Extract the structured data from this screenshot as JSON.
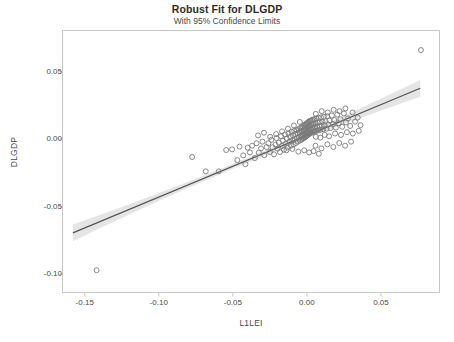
{
  "chart_data": {
    "type": "scatter",
    "title": "Robust Fit for DLGDP",
    "subtitle": "With 95% Confidence Limits",
    "xlabel": "L1LEI",
    "ylabel": "DLGDP",
    "xlim": [
      -0.165,
      0.0895
    ],
    "ylim": [
      -0.1135,
      0.0805
    ],
    "xticks": [
      -0.15,
      -0.1,
      -0.05,
      0.0,
      0.05
    ],
    "xtick_labels": [
      "-0.15",
      "-0.10",
      "-0.05",
      "0.00",
      "0.05"
    ],
    "yticks": [
      0.05,
      0.0,
      -0.05,
      -0.1
    ],
    "ytick_labels": [
      "0.05",
      "0.00",
      "-0.05",
      "-0.10"
    ],
    "grid": false,
    "legend": false,
    "marker": {
      "shape": "open-circle",
      "size": 5,
      "color": "#7a7a7a",
      "fill": "none"
    },
    "fit_line": {
      "label": "Robust fit",
      "color": "#555555",
      "slope": 0.4565,
      "intercept": 0.0028,
      "x_start": -0.158,
      "x_end": 0.0765
    },
    "confidence_band": {
      "label": "95% Confidence Limits",
      "level": 0.95,
      "color": "#cfcfcf",
      "half_width_center": 0.0018,
      "half_width_edge": 0.0062
    },
    "points": [
      [
        -0.142,
        -0.097
      ],
      [
        -0.0775,
        -0.0132
      ],
      [
        -0.0683,
        -0.0238
      ],
      [
        -0.0595,
        -0.0238
      ],
      [
        -0.0545,
        -0.008
      ],
      [
        -0.0505,
        -0.0075
      ],
      [
        -0.047,
        -0.0155
      ],
      [
        -0.0455,
        -0.0055
      ],
      [
        -0.043,
        -0.012
      ],
      [
        -0.0415,
        -0.0185
      ],
      [
        -0.04,
        -0.0062
      ],
      [
        -0.0385,
        -0.0098
      ],
      [
        -0.037,
        -0.0048
      ],
      [
        -0.0352,
        -0.014
      ],
      [
        -0.034,
        -0.003
      ],
      [
        -0.0325,
        -0.01
      ],
      [
        -0.031,
        -0.0068
      ],
      [
        -0.03,
        -0.0018
      ],
      [
        -0.0288,
        -0.0118
      ],
      [
        -0.0272,
        -0.0058
      ],
      [
        -0.026,
        -0.003
      ],
      [
        -0.025,
        -0.0095
      ],
      [
        -0.024,
        -0.0005
      ],
      [
        -0.0232,
        -0.006
      ],
      [
        -0.0222,
        -0.0112
      ],
      [
        -0.0212,
        -0.004
      ],
      [
        -0.0205,
        0.0008
      ],
      [
        -0.0198,
        -0.007
      ],
      [
        -0.019,
        -0.0025
      ],
      [
        -0.0182,
        -0.0095
      ],
      [
        -0.0175,
        0.0022
      ],
      [
        -0.0168,
        -0.005
      ],
      [
        -0.0162,
        -0.001
      ],
      [
        -0.0155,
        -0.0078
      ],
      [
        -0.0148,
        0.0035
      ],
      [
        -0.0142,
        -0.0032
      ],
      [
        -0.0136,
        0.0005
      ],
      [
        -0.013,
        -0.0062
      ],
      [
        -0.0124,
        0.0042
      ],
      [
        -0.0118,
        -0.0018
      ],
      [
        -0.0113,
        0.0018
      ],
      [
        -0.0108,
        -0.0048
      ],
      [
        -0.0103,
        0.0055
      ],
      [
        -0.0098,
        -0.0008
      ],
      [
        -0.0094,
        0.0028
      ],
      [
        -0.009,
        -0.0038
      ],
      [
        -0.0086,
        0.0062
      ],
      [
        -0.0082,
        0.0002
      ],
      [
        -0.0078,
        0.0038
      ],
      [
        -0.0074,
        -0.0028
      ],
      [
        -0.007,
        0.0068
      ],
      [
        -0.0066,
        0.001
      ],
      [
        -0.0063,
        0.0045
      ],
      [
        -0.006,
        -0.0018
      ],
      [
        -0.0057,
        0.0075
      ],
      [
        -0.0054,
        0.0015
      ],
      [
        -0.0051,
        0.005
      ],
      [
        -0.0048,
        -0.001
      ],
      [
        -0.0045,
        0.0082
      ],
      [
        -0.0043,
        0.0022
      ],
      [
        -0.004,
        0.0055
      ],
      [
        -0.0038,
        -0.0004
      ],
      [
        -0.0036,
        0.0088
      ],
      [
        -0.0034,
        0.0028
      ],
      [
        -0.0032,
        0.006
      ],
      [
        -0.003,
        0.0002
      ],
      [
        -0.0028,
        0.0095
      ],
      [
        -0.0026,
        0.0032
      ],
      [
        -0.0024,
        0.0065
      ],
      [
        -0.0022,
        0.0008
      ],
      [
        -0.002,
        0.01
      ],
      [
        -0.0019,
        0.0038
      ],
      [
        -0.0017,
        0.007
      ],
      [
        -0.0016,
        0.0012
      ],
      [
        -0.0014,
        0.0105
      ],
      [
        -0.0013,
        0.0042
      ],
      [
        -0.0011,
        0.0075
      ],
      [
        -0.001,
        0.0018
      ],
      [
        -0.0009,
        0.011
      ],
      [
        -0.0007,
        0.0048
      ],
      [
        -0.0006,
        0.008
      ],
      [
        -0.0005,
        0.0022
      ],
      [
        -0.0004,
        0.0115
      ],
      [
        -0.0002,
        0.0052
      ],
      [
        -0.0001,
        0.0085
      ],
      [
        0.0,
        0.0028
      ],
      [
        0.0002,
        0.012
      ],
      [
        0.0003,
        0.0058
      ],
      [
        0.0004,
        0.009
      ],
      [
        0.0006,
        0.0032
      ],
      [
        0.0007,
        0.0125
      ],
      [
        0.0008,
        0.0062
      ],
      [
        0.001,
        0.0095
      ],
      [
        0.0011,
        0.0038
      ],
      [
        0.0013,
        0.013
      ],
      [
        0.0014,
        0.0068
      ],
      [
        0.0016,
        0.0098
      ],
      [
        0.0017,
        0.0042
      ],
      [
        0.0019,
        0.0135
      ],
      [
        0.0021,
        0.0072
      ],
      [
        0.0022,
        0.0102
      ],
      [
        0.0024,
        0.0046
      ],
      [
        0.0026,
        0.0138
      ],
      [
        0.0028,
        0.0076
      ],
      [
        0.003,
        0.0106
      ],
      [
        0.0032,
        0.005
      ],
      [
        0.0034,
        0.0142
      ],
      [
        0.0036,
        0.008
      ],
      [
        0.0038,
        0.011
      ],
      [
        0.004,
        0.0054
      ],
      [
        0.0043,
        0.0146
      ],
      [
        0.0045,
        0.0084
      ],
      [
        0.0048,
        0.0114
      ],
      [
        0.005,
        0.0058
      ],
      [
        0.0053,
        0.015
      ],
      [
        0.0056,
        0.0088
      ],
      [
        0.0059,
        0.0118
      ],
      [
        0.0062,
        0.0062
      ],
      [
        0.0065,
        0.0154
      ],
      [
        0.0068,
        0.0092
      ],
      [
        0.0072,
        0.0122
      ],
      [
        0.0075,
        0.0066
      ],
      [
        0.0079,
        0.0158
      ],
      [
        0.0083,
        0.0096
      ],
      [
        0.0087,
        0.0126
      ],
      [
        0.0091,
        0.007
      ],
      [
        0.0095,
        0.0162
      ],
      [
        0.01,
        0.01
      ],
      [
        0.0105,
        0.013
      ],
      [
        0.011,
        0.0074
      ],
      [
        0.0115,
        0.0166
      ],
      [
        0.012,
        0.0104
      ],
      [
        0.0126,
        0.0134
      ],
      [
        0.0132,
        0.0078
      ],
      [
        0.0138,
        0.017
      ],
      [
        0.0145,
        0.0108
      ],
      [
        0.0152,
        0.0138
      ],
      [
        0.016,
        0.0082
      ],
      [
        0.0168,
        0.0176
      ],
      [
        0.0176,
        0.0112
      ],
      [
        0.0185,
        0.0142
      ],
      [
        0.0195,
        0.0086
      ],
      [
        0.0205,
        0.0182
      ],
      [
        0.0215,
        0.0118
      ],
      [
        0.0226,
        0.0148
      ],
      [
        0.0238,
        0.0092
      ],
      [
        0.025,
        0.019
      ],
      [
        0.0263,
        0.0124
      ],
      [
        0.0277,
        0.0154
      ],
      [
        0.0292,
        0.0098
      ],
      [
        0.0308,
        0.0198
      ],
      [
        0.0325,
        0.013
      ],
      [
        0.0343,
        0.016
      ],
      [
        0.0362,
        0.0104
      ],
      [
        -0.0048,
        0.0128
      ],
      [
        -0.0088,
        0.0102
      ],
      [
        -0.0128,
        0.0078
      ],
      [
        -0.0168,
        0.0058
      ],
      [
        -0.0208,
        0.0038
      ],
      [
        -0.0248,
        0.0018
      ],
      [
        -0.029,
        0.0048
      ],
      [
        -0.033,
        0.0028
      ],
      [
        0.0058,
        -0.0048
      ],
      [
        0.0098,
        -0.0068
      ],
      [
        0.0138,
        -0.0038
      ],
      [
        0.0178,
        -0.0058
      ],
      [
        0.0218,
        -0.0028
      ],
      [
        0.0258,
        -0.0048
      ],
      [
        0.0298,
        -0.0018
      ],
      [
        0.006,
        0.0188
      ],
      [
        0.01,
        0.0208
      ],
      [
        0.014,
        0.0198
      ],
      [
        0.018,
        0.0218
      ],
      [
        0.022,
        0.0208
      ],
      [
        0.026,
        0.0228
      ],
      [
        0.006,
        0.0018
      ],
      [
        0.009,
        0.0012
      ],
      [
        0.012,
        0.0032
      ],
      [
        0.015,
        0.0022
      ],
      [
        0.019,
        0.0042
      ],
      [
        0.023,
        0.0032
      ],
      [
        0.027,
        0.0052
      ],
      [
        0.031,
        0.0042
      ],
      [
        0.035,
        0.0062
      ],
      [
        0.0015,
        -0.0098
      ],
      [
        0.0045,
        -0.0088
      ],
      [
        0.008,
        -0.0108
      ],
      [
        -0.0018,
        -0.0082
      ],
      [
        -0.0058,
        -0.0092
      ],
      [
        -0.0098,
        -0.0072
      ],
      [
        -0.0138,
        -0.0082
      ],
      [
        0.077,
        0.066
      ]
    ]
  }
}
